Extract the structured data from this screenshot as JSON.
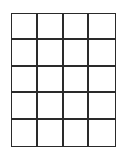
{
  "grid": {
    "rows": 5,
    "columns": 4,
    "line_color": "#2a2a2a",
    "fill_color": "#ffffff",
    "cells": [
      [
        "",
        "",
        "",
        ""
      ],
      [
        "",
        "",
        "",
        ""
      ],
      [
        "",
        "",
        "",
        ""
      ],
      [
        "",
        "",
        "",
        ""
      ],
      [
        "",
        "",
        "",
        ""
      ]
    ]
  }
}
